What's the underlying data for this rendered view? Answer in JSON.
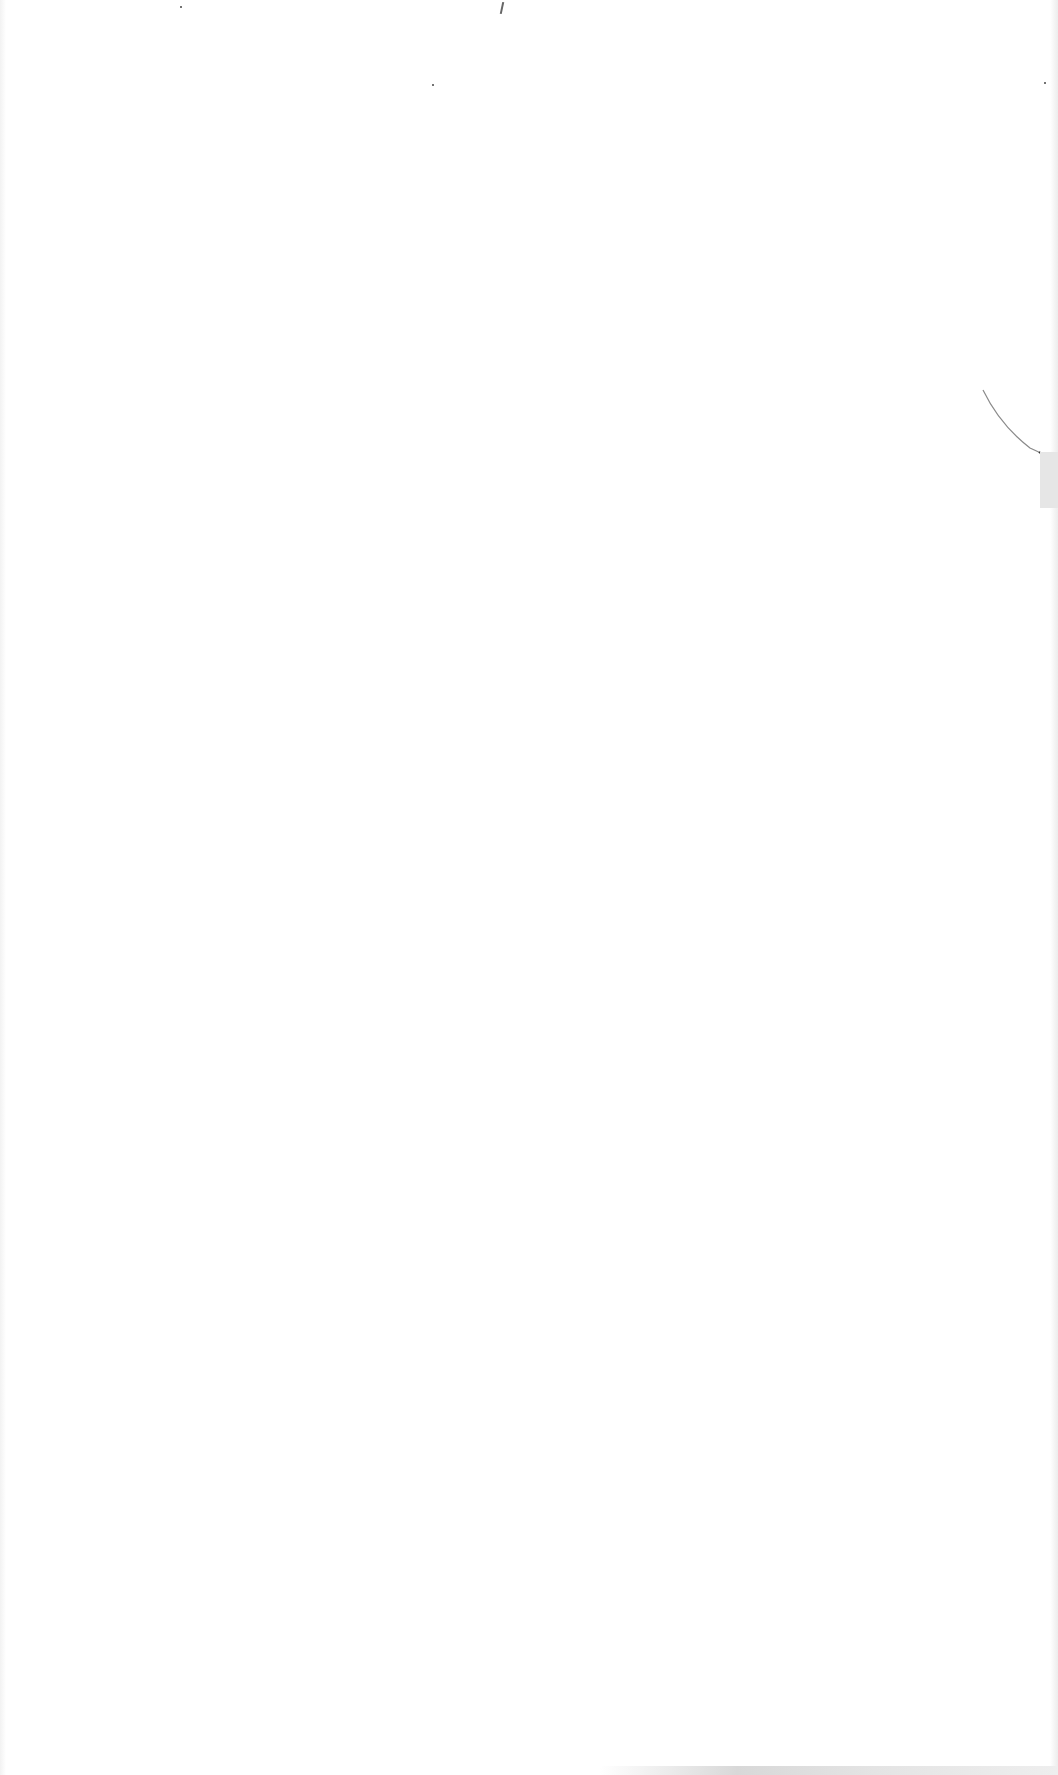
{
  "page": {
    "type": "blank-scanned-page",
    "background_color": "#ffffff",
    "text_content": []
  },
  "artifacts": {
    "right_tab_color": "#e6e6e6",
    "curve_stroke_color": "#8a8a8a",
    "speck_color": "#444444"
  }
}
